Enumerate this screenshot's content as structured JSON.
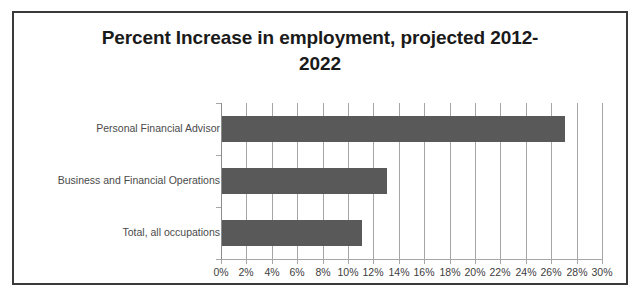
{
  "chart_data": {
    "type": "bar",
    "orientation": "horizontal",
    "title_line1": "Percent Increase in employment, projected 2012-",
    "title_line2": "2022",
    "categories": [
      "Personal Financial Advisor",
      "Business and Financial Operations",
      "Total, all occupations"
    ],
    "values": [
      27,
      13,
      11
    ],
    "xlabel": "",
    "ylabel": "",
    "xlim": [
      0,
      30
    ],
    "xtick_step": 2,
    "xticks": [
      0,
      2,
      4,
      6,
      8,
      10,
      12,
      14,
      16,
      18,
      20,
      22,
      24,
      26,
      28,
      30
    ],
    "xtick_labels": [
      "0%",
      "2%",
      "4%",
      "6%",
      "8%",
      "10%",
      "12%",
      "14%",
      "16%",
      "18%",
      "20%",
      "22%",
      "24%",
      "26%",
      "28%",
      "30%"
    ],
    "grid": true,
    "grid_axis": "x",
    "legend": false,
    "legend_position": "none",
    "bar_color": "#595959",
    "gridline_color": "#a6a6a6",
    "plot_background": "#ffffff",
    "frame_border_color": "#3a3a3a",
    "title_color": "#1a1a1a",
    "tick_label_color": "#3d3d3d",
    "category_label_color": "#4a4a4a"
  }
}
